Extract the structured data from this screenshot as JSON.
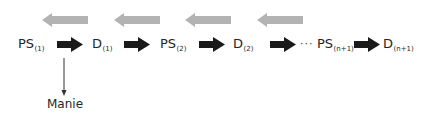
{
  "diagram": {
    "colors": {
      "forward_arrow": "#1a1a1a",
      "backward_arrow": "#b3b3b3",
      "text": "#262626"
    },
    "nodes": [
      {
        "main": "PS",
        "sub": "(1)"
      },
      {
        "main": "D",
        "sub": "(1)"
      },
      {
        "main": "PS",
        "sub": "(2)"
      },
      {
        "main": "D",
        "sub": "(2)"
      },
      {
        "main": "PS",
        "sub": "(n+1)"
      },
      {
        "main": "D",
        "sub": "(n+1)"
      }
    ],
    "ellipsis": "···",
    "branch_label": "Manie",
    "forward_arrow_icon": "right-arrow-icon",
    "backward_arrow_icon": "left-arrow-icon"
  }
}
